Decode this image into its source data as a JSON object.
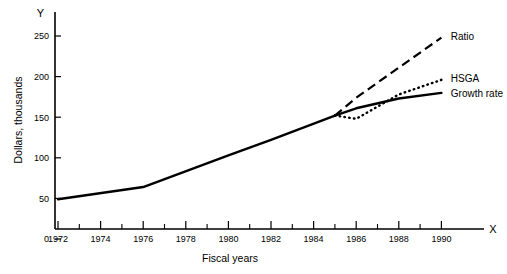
{
  "chart_data": {
    "type": "line",
    "title": "",
    "xlabel": "Fiscal years",
    "ylabel": "Dollars, thousands",
    "x_axis_letter": "X",
    "y_axis_letter": "Y",
    "xlim": [
      1971,
      1991.4
    ],
    "ylim": [
      0,
      268
    ],
    "grid": false,
    "legend_position": "inline-right-of-line-ends",
    "x_ticks_major": [
      1972,
      1974,
      1976,
      1978,
      1980,
      1982,
      1984,
      1986,
      1988,
      1990
    ],
    "x_ticks_minor": [
      1973,
      1975,
      1977,
      1979,
      1981,
      1983,
      1985,
      1987,
      1989
    ],
    "y_ticks": [
      0,
      50,
      100,
      150,
      200,
      250
    ],
    "x_tick_labels": [
      "1972",
      "1974",
      "1976",
      "1978",
      "1980",
      "1982",
      "1984",
      "1986",
      "1988",
      "1990"
    ],
    "y_tick_labels": [
      "0",
      "50",
      "100",
      "150",
      "200",
      "250"
    ],
    "series": [
      {
        "name": "Common trunk",
        "label": "",
        "style": "solid",
        "x": [
          1972,
          1976,
          1980,
          1982,
          1985
        ],
        "values": [
          49,
          64,
          103,
          122,
          152
        ]
      },
      {
        "name": "Ratio",
        "label": "Ratio",
        "style": "dashed",
        "x": [
          1985,
          1986,
          1988,
          1990
        ],
        "values": [
          152,
          174,
          211,
          248
        ]
      },
      {
        "name": "HSGA",
        "label": "HSGA",
        "style": "dotted",
        "x": [
          1985,
          1986,
          1988,
          1990
        ],
        "values": [
          152,
          148,
          178,
          196
        ]
      },
      {
        "name": "Growth rate",
        "label": "Growth rate",
        "style": "solid",
        "x": [
          1985,
          1986,
          1988,
          1990
        ],
        "values": [
          152,
          161,
          173,
          180
        ]
      }
    ],
    "annotations": [
      {
        "text": "Ratio",
        "x": 1990.3,
        "y": 249
      },
      {
        "text": "HSGA",
        "x": 1990.3,
        "y": 198
      },
      {
        "text": "Growth rate",
        "x": 1990.3,
        "y": 179
      }
    ]
  }
}
